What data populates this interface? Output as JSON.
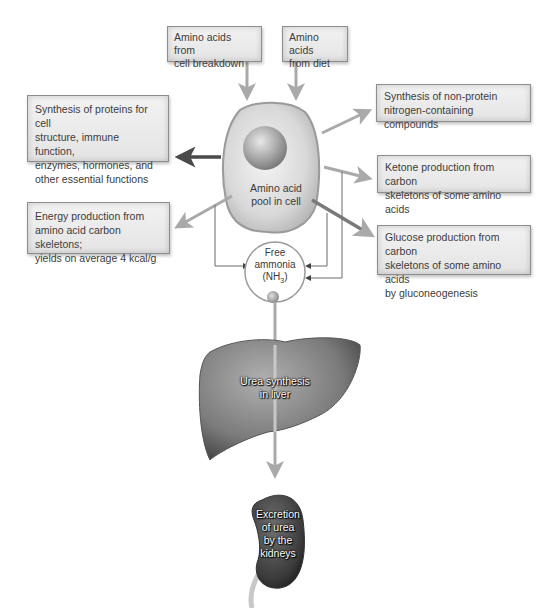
{
  "diagram": {
    "sources": [
      {
        "id": "cell-breakdown",
        "lines": [
          "Amino acids from",
          "cell breakdown"
        ]
      },
      {
        "id": "diet",
        "lines": [
          "Amino acids",
          "from diet"
        ]
      }
    ],
    "pool": {
      "lines": [
        "Amino acid",
        "pool in cell"
      ]
    },
    "outputs": [
      {
        "id": "protein-synthesis",
        "lines": [
          "Synthesis of proteins for cell",
          "structure, immune function,",
          "enzymes, hormones, and",
          "other essential functions"
        ]
      },
      {
        "id": "energy",
        "lines": [
          "Energy production from",
          "amino acid carbon skeletons;",
          "yields on average 4 kcal/g"
        ]
      },
      {
        "id": "non-protein",
        "lines": [
          "Synthesis of non-protein",
          "nitrogen-containing compounds"
        ]
      },
      {
        "id": "ketone",
        "lines": [
          "Ketone production from carbon",
          "skeletons of some amino acids"
        ]
      },
      {
        "id": "glucose",
        "lines": [
          "Glucose production from carbon",
          "skeletons of some amino acids",
          "by gluconeogenesis"
        ]
      }
    ],
    "ammonia": {
      "lines": [
        "Free",
        "ammonia"
      ],
      "formula_base": "(NH",
      "formula_sub": "3",
      "formula_end": ")"
    },
    "liver": {
      "lines": [
        "Urea synthesis",
        "in liver"
      ]
    },
    "kidney": {
      "lines": [
        "Excretion",
        "of urea",
        "by the",
        "kidneys"
      ]
    },
    "colors": {
      "arrow_light": "#a9a9a9",
      "arrow_dark": "#4a4a4a",
      "thin_line": "#7a7a7a",
      "box_border": "#8e8e8e"
    }
  }
}
